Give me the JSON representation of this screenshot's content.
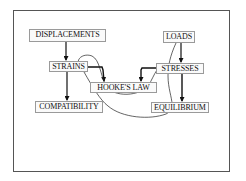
{
  "diagram": {
    "nodes": {
      "displacements": {
        "label": "DISPLACEMENTS"
      },
      "loads": {
        "label": "LOADS"
      },
      "strains": {
        "label": "STRAINS"
      },
      "stresses": {
        "label": "STRESSES"
      },
      "hookes_law": {
        "label": "HOOKE'S LAW"
      },
      "compatibility": {
        "label": "COMPATIBILITY"
      },
      "equilibrium": {
        "label": "EQUILIBRIUM"
      }
    },
    "edges": [
      {
        "from": "DISPLACEMENTS",
        "to": "STRAINS",
        "style": "arrow"
      },
      {
        "from": "STRAINS",
        "to": "COMPATIBILITY",
        "style": "arrow"
      },
      {
        "from": "STRAINS",
        "to": "HOOKE'S LAW",
        "style": "elbow-arrow"
      },
      {
        "from": "STRESSES",
        "to": "HOOKE'S LAW",
        "style": "elbow-arrow"
      },
      {
        "from": "LOADS",
        "to": "STRESSES",
        "style": "arrow"
      },
      {
        "from": "STRESSES",
        "to": "EQUILIBRIUM",
        "style": "arrow"
      },
      {
        "from": "STRAINS",
        "to": "STRESSES",
        "style": "hand-drawn-curve"
      },
      {
        "from": "STRAINS",
        "to": "EQUILIBRIUM",
        "style": "hand-drawn-curve"
      },
      {
        "from": "LOADS",
        "to": "EQUILIBRIUM",
        "style": "hand-drawn-curve"
      }
    ],
    "colors": {
      "line": "#111111",
      "box_border": "#9a9a9a",
      "frame": "#555555",
      "background": "#ffffff"
    }
  }
}
